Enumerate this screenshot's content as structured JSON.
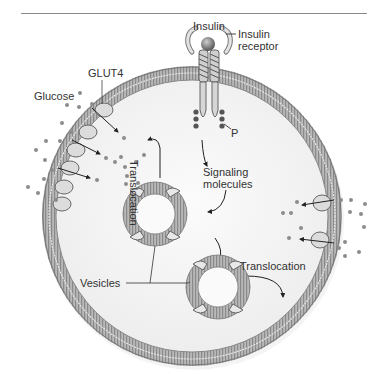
{
  "diagram": {
    "type": "biological-cell-diagram",
    "labels": {
      "insulin": "Insulin",
      "insulin_receptor_line1": "Insulin",
      "insulin_receptor_line2": "receptor",
      "glut4": "GLUT4",
      "glucose": "Glucose",
      "phosphate": "P",
      "signaling_line1": "Signaling",
      "signaling_line2": "molecules",
      "translocation_vertical": "Translocation",
      "translocation_horizontal": "Translocation",
      "vesicles": "Vesicles"
    },
    "colors": {
      "membrane": "#9a9a9a",
      "membrane_dark": "#6e6e6e",
      "cytoplasm": "#f2f2f2",
      "glucose": "#8c8c8c",
      "transporter": "#d9d9d9",
      "text": "#333333",
      "rule": "#8a8a8a"
    }
  }
}
